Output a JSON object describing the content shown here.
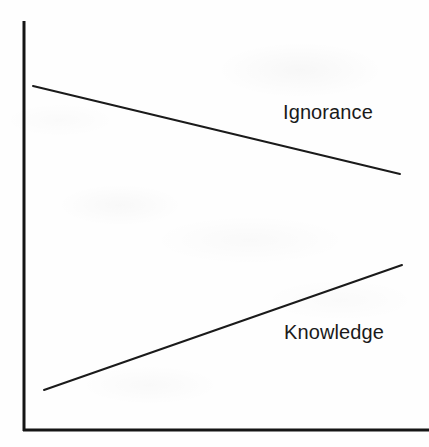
{
  "figure": {
    "width": 429,
    "height": 447,
    "background_color": "#fefefe",
    "ink_color": "#1a1a1a"
  },
  "chart_data": {
    "type": "line",
    "title": "",
    "subtitle": "",
    "xlabel": "",
    "ylabel": "",
    "xlim": [
      0,
      100
    ],
    "ylim": [
      0,
      100
    ],
    "grid": false,
    "axis_ticks": false,
    "tick_labels": [],
    "legend": "inline-labels",
    "legend_position": "inline-right",
    "annotations": [],
    "series": [
      {
        "name": "Ignorance",
        "label": "Ignorance",
        "color": "#1a1a1a",
        "direction": "decreasing",
        "x": [
          2,
          100
        ],
        "y": [
          85,
          63
        ],
        "pixel_start": [
          33,
          86
        ],
        "pixel_end": [
          400,
          174
        ]
      },
      {
        "name": "Knowledge",
        "label": "Knowledge",
        "color": "#1a1a1a",
        "direction": "increasing",
        "x": [
          5,
          100
        ],
        "y": [
          10,
          41
        ],
        "pixel_start": [
          44,
          390
        ],
        "pixel_end": [
          402,
          265
        ]
      }
    ]
  },
  "axes": {
    "y_axis": {
      "name": "y-axis",
      "x": 24,
      "y_top": 21,
      "y_bottom": 431,
      "thickness": 3
    },
    "x_axis": {
      "name": "x-axis",
      "y": 430,
      "x_left": 24,
      "x_right": 429,
      "thickness": 3
    }
  },
  "labels": {
    "ignorance": "Ignorance",
    "knowledge": "Knowledge"
  }
}
